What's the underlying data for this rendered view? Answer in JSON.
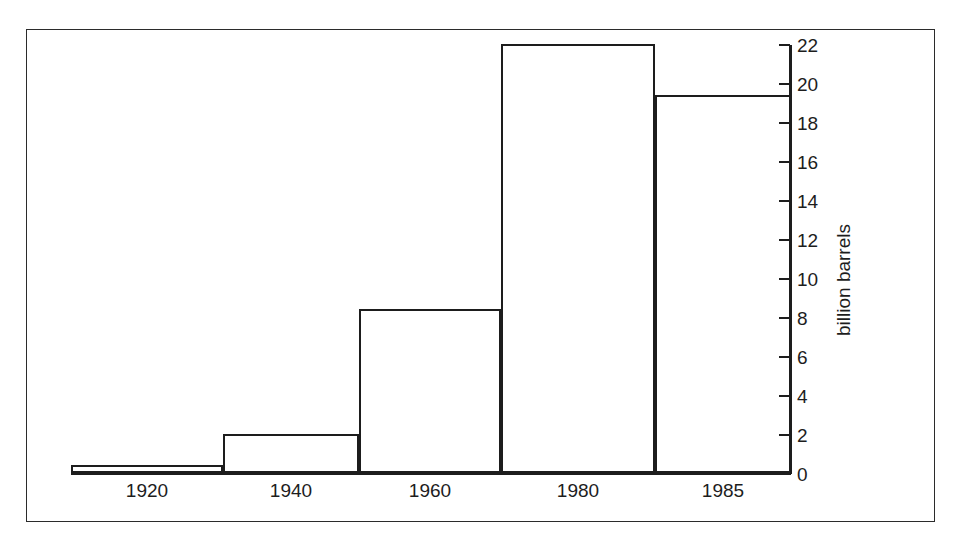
{
  "chart_data": {
    "type": "bar",
    "title": "",
    "subtitle": "",
    "xlabel": "",
    "ylabel": "billion barrels",
    "categories": [
      "1920",
      "1940",
      "1960",
      "1980",
      "1985"
    ],
    "values": [
      0.4,
      2.0,
      8.4,
      22.0,
      19.4
    ],
    "series": [
      {
        "name": "billion barrels",
        "values": [
          0.4,
          2.0,
          8.4,
          22.0,
          19.4
        ]
      }
    ],
    "ylim": [
      0,
      22
    ],
    "yticks": [
      0,
      2,
      4,
      6,
      8,
      10,
      12,
      14,
      16,
      18,
      20,
      22
    ],
    "ytick_labels": [
      "0",
      "2",
      "4",
      "6",
      "8",
      "10",
      "12",
      "14",
      "16",
      "18",
      "20",
      "22"
    ],
    "grid": false,
    "legend": null,
    "legend_position": "none",
    "y_axis_side": "right",
    "bar_style": "histogram-contiguous-outlined",
    "annotations": [],
    "colors": {
      "bar_fill": "#ffffff",
      "bar_stroke": "#1d1d1d",
      "axis": "#1d1d1d",
      "frame": "#2b2b2b",
      "background": "#ffffff",
      "text": "#1d1d1d"
    }
  },
  "figure": {
    "frame_visible": true
  }
}
